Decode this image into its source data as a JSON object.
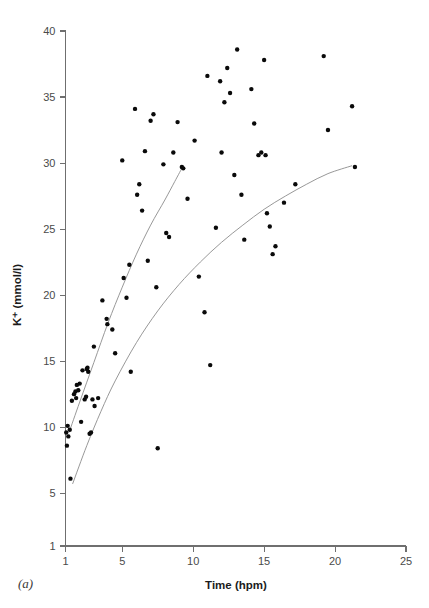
{
  "figure": {
    "panel_label": "(a)"
  },
  "chart_data": {
    "type": "scatter",
    "title": "",
    "xlabel": "Time (hpm)",
    "ylabel": "K⁺ (mmol/l)",
    "xlim": [
      1,
      25
    ],
    "ylim": [
      1,
      40
    ],
    "xticks": [
      1,
      5,
      10,
      15,
      20,
      25
    ],
    "xtick_labels": [
      "1",
      "5",
      "10",
      "15",
      "20",
      "25"
    ],
    "yticks": [
      1,
      5,
      10,
      15,
      20,
      25,
      30,
      35,
      40
    ],
    "ytick_labels": [
      "1",
      "5",
      "10",
      "15",
      "20",
      "25",
      "30",
      "35",
      "40"
    ],
    "grid": false,
    "legend": "none",
    "marker": "filled-circle",
    "marker_color": "#0a0a0a",
    "curve_color": "#8c8c8c",
    "points": [
      [
        1.05,
        9.6
      ],
      [
        1.1,
        8.6
      ],
      [
        1.15,
        10.1
      ],
      [
        1.2,
        9.3
      ],
      [
        1.3,
        9.8
      ],
      [
        1.35,
        6.1
      ],
      [
        1.45,
        12.0
      ],
      [
        1.6,
        12.5
      ],
      [
        1.7,
        12.7
      ],
      [
        1.75,
        12.2
      ],
      [
        1.8,
        13.2
      ],
      [
        1.9,
        12.8
      ],
      [
        2.0,
        13.3
      ],
      [
        2.1,
        10.4
      ],
      [
        2.2,
        14.3
      ],
      [
        2.35,
        12.1
      ],
      [
        2.45,
        12.3
      ],
      [
        2.5,
        14.4
      ],
      [
        2.55,
        14.5
      ],
      [
        2.6,
        14.2
      ],
      [
        2.7,
        9.5
      ],
      [
        2.8,
        9.6
      ],
      [
        2.9,
        12.1
      ],
      [
        3.0,
        16.1
      ],
      [
        3.05,
        11.6
      ],
      [
        3.3,
        12.2
      ],
      [
        3.6,
        19.6
      ],
      [
        3.9,
        18.2
      ],
      [
        3.95,
        17.8
      ],
      [
        4.3,
        17.4
      ],
      [
        4.5,
        15.6
      ],
      [
        5.0,
        30.2
      ],
      [
        5.1,
        21.3
      ],
      [
        5.3,
        19.8
      ],
      [
        5.5,
        22.3
      ],
      [
        5.6,
        14.2
      ],
      [
        5.9,
        34.1
      ],
      [
        6.05,
        27.6
      ],
      [
        6.2,
        28.4
      ],
      [
        6.4,
        26.4
      ],
      [
        6.6,
        30.9
      ],
      [
        6.8,
        22.6
      ],
      [
        7.0,
        33.2
      ],
      [
        7.2,
        33.7
      ],
      [
        7.4,
        20.6
      ],
      [
        7.5,
        8.4
      ],
      [
        7.9,
        29.9
      ],
      [
        8.1,
        24.7
      ],
      [
        8.3,
        24.4
      ],
      [
        8.6,
        30.8
      ],
      [
        8.9,
        33.1
      ],
      [
        9.2,
        29.7
      ],
      [
        9.3,
        29.6
      ],
      [
        9.6,
        27.3
      ],
      [
        10.1,
        31.7
      ],
      [
        10.4,
        21.4
      ],
      [
        10.8,
        18.7
      ],
      [
        11.0,
        36.6
      ],
      [
        11.2,
        14.7
      ],
      [
        11.6,
        25.1
      ],
      [
        11.9,
        36.2
      ],
      [
        12.0,
        30.8
      ],
      [
        12.2,
        34.6
      ],
      [
        12.4,
        37.2
      ],
      [
        12.6,
        35.3
      ],
      [
        12.9,
        29.1
      ],
      [
        13.1,
        38.6
      ],
      [
        13.4,
        27.6
      ],
      [
        13.6,
        24.2
      ],
      [
        14.1,
        35.6
      ],
      [
        14.3,
        33.0
      ],
      [
        14.6,
        30.6
      ],
      [
        14.8,
        30.8
      ],
      [
        15.0,
        37.8
      ],
      [
        15.1,
        30.6
      ],
      [
        15.2,
        26.2
      ],
      [
        15.4,
        25.2
      ],
      [
        15.6,
        23.1
      ],
      [
        15.8,
        23.7
      ],
      [
        16.4,
        27.0
      ],
      [
        17.2,
        28.4
      ],
      [
        19.2,
        38.1
      ],
      [
        19.5,
        32.5
      ],
      [
        21.2,
        34.3
      ],
      [
        21.4,
        29.7
      ]
    ],
    "curves": [
      {
        "name": "upper-fit-curve",
        "points": [
          [
            1.25,
            9.6
          ],
          [
            2.0,
            11.9
          ],
          [
            3.0,
            14.9
          ],
          [
            4.0,
            17.9
          ],
          [
            5.0,
            20.6
          ],
          [
            6.0,
            23.1
          ],
          [
            7.0,
            25.3
          ],
          [
            8.0,
            27.2
          ],
          [
            8.7,
            28.6
          ],
          [
            9.3,
            29.8
          ]
        ]
      },
      {
        "name": "lower-fit-curve",
        "points": [
          [
            1.5,
            5.7
          ],
          [
            2.5,
            8.6
          ],
          [
            3.5,
            11.2
          ],
          [
            4.5,
            13.5
          ],
          [
            6.0,
            16.4
          ],
          [
            7.5,
            18.8
          ],
          [
            9.0,
            20.8
          ],
          [
            10.5,
            22.5
          ],
          [
            12.0,
            24.0
          ],
          [
            13.5,
            25.3
          ],
          [
            15.0,
            26.5
          ],
          [
            16.5,
            27.5
          ],
          [
            18.0,
            28.4
          ],
          [
            19.5,
            29.2
          ],
          [
            21.2,
            29.8
          ]
        ]
      }
    ]
  }
}
